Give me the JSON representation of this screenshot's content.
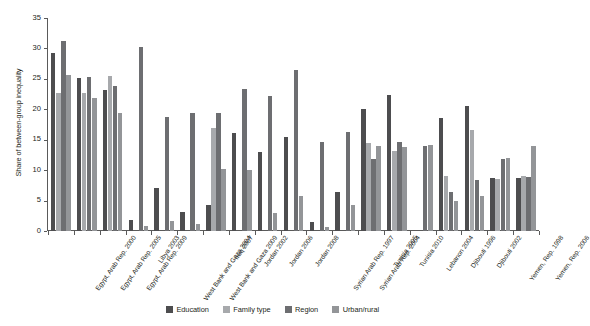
{
  "chart_data": {
    "type": "bar",
    "title": "",
    "subtitle": "",
    "xlabel": "",
    "ylabel": "Share of between-group inequality",
    "ylim": [
      0,
      35
    ],
    "yticks": [
      0,
      5,
      10,
      15,
      20,
      25,
      30,
      35
    ],
    "grid": false,
    "legend_position": "bottom",
    "categories": [
      "Egypt, Arab Rep. 2000",
      "Egypt, Arab Rep. 2005",
      "Egypt, Arab Rep. 2009",
      "Libya 2003",
      "West Bank and Gaza 2004",
      "West Bank and Gaza 2009",
      "Iraq 2007",
      "Jordan 2002",
      "Jordan 2006",
      "Jordan 2008",
      "Syrian Arab Rep. 1997",
      "Syrian Arab Rep. 2004",
      "Tunisia 2005",
      "Tunisia 2010",
      "Lebanon 2004",
      "Djibouti 1996",
      "Djibouti 2002",
      "Yemen, Rep. 1998",
      "Yemen, Rep. 2006"
    ],
    "series": [
      {
        "name": "Education",
        "color": "#4d4d4f",
        "values": [
          29.3,
          25.2,
          23.2,
          1.8,
          7.1,
          3.2,
          4.3,
          16.1,
          13.0,
          15.5,
          1.5,
          6.4,
          20.1,
          22.3,
          0.0,
          18.6,
          20.6,
          8.7,
          8.7
        ]
      },
      {
        "name": "Family type",
        "color": "#a7a9ac",
        "values": [
          22.6,
          22.7,
          25.5,
          0.0,
          0.0,
          0.0,
          16.9,
          0.0,
          0.0,
          0.0,
          0.0,
          0.0,
          14.5,
          13.2,
          0.0,
          9.1,
          16.6,
          8.6,
          9.1
        ]
      },
      {
        "name": "Region",
        "color": "#6d6e71",
        "values": [
          31.3,
          25.3,
          23.8,
          30.2,
          18.7,
          19.4,
          19.4,
          23.4,
          22.2,
          26.4,
          14.7,
          16.2,
          11.8,
          14.7,
          14.0,
          6.4,
          8.4,
          11.9,
          8.8
        ]
      },
      {
        "name": "Urban/rural",
        "color": "#939598",
        "values": [
          25.7,
          21.8,
          19.4,
          0.9,
          1.7,
          1.1,
          10.2,
          10.1,
          2.9,
          5.8,
          0.6,
          4.3,
          14.0,
          13.8,
          14.1,
          5.0,
          5.7,
          12.0,
          14.0
        ]
      }
    ]
  },
  "legend": {
    "items": [
      {
        "label": "Education",
        "color": "#4d4d4f"
      },
      {
        "label": "Family type",
        "color": "#a7a9ac"
      },
      {
        "label": "Region",
        "color": "#6d6e71"
      },
      {
        "label": "Urban/rural",
        "color": "#939598"
      }
    ]
  },
  "axis": {
    "y_title": "Share of between-group inequality"
  }
}
